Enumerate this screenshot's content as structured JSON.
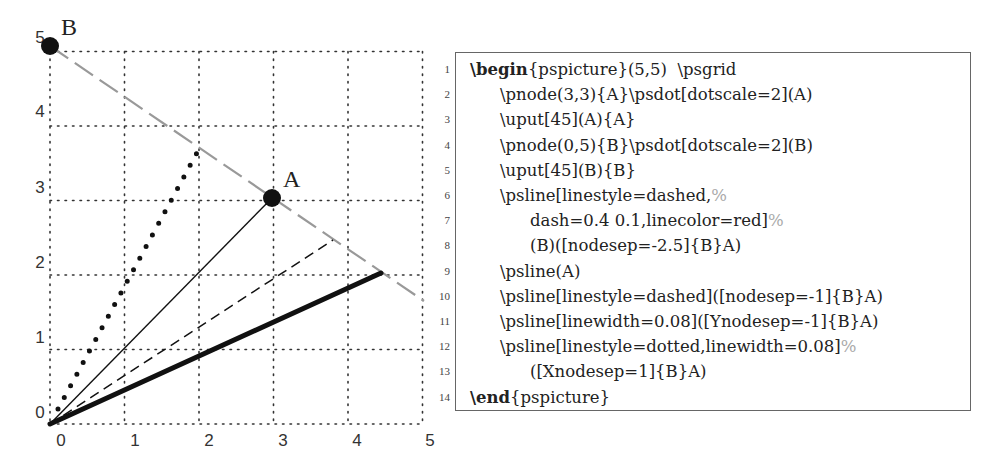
{
  "chart_data": {
    "type": "diagram",
    "title": "",
    "grid": {
      "xmin": 0,
      "xmax": 5,
      "ymin": 0,
      "ymax": 5,
      "style": "dotted"
    },
    "x_tick_labels": [
      "0",
      "1",
      "2",
      "3",
      "4",
      "5"
    ],
    "y_tick_labels": [
      "0",
      "1",
      "2",
      "3",
      "4",
      "5"
    ],
    "nodes": [
      {
        "name": "A",
        "x": 3,
        "y": 3,
        "label": "A",
        "dotscale": 2
      },
      {
        "name": "B",
        "x": 0,
        "y": 5,
        "label": "B",
        "dotscale": 2
      }
    ],
    "lines": [
      {
        "id": "extended-dashed-gray",
        "style": "long-dashed",
        "color": "#999999",
        "from": [
          0,
          5
        ],
        "to": [
          5,
          1.67
        ]
      },
      {
        "id": "solid-to-A",
        "style": "solid",
        "color": "#000000",
        "from": [
          0,
          0
        ],
        "to": [
          3,
          3
        ]
      },
      {
        "id": "dashed-nodesep",
        "style": "dashed",
        "color": "#000000",
        "from": [
          0,
          0
        ],
        "to": [
          3.83,
          2.45
        ]
      },
      {
        "id": "thick-ynodesep",
        "style": "solid-thick",
        "color": "#000000",
        "from": [
          0,
          0
        ],
        "to": [
          4.5,
          2
        ]
      },
      {
        "id": "dotted-xnodesep",
        "style": "dotted-thick",
        "color": "#000000",
        "from": [
          0,
          0
        ],
        "to": [
          2,
          3.67
        ]
      }
    ]
  },
  "figure": {
    "axis": {
      "x_labels": [
        "0",
        "1",
        "2",
        "3",
        "4",
        "5"
      ],
      "y_labels": [
        "0",
        "1",
        "2",
        "3",
        "4",
        "5"
      ]
    },
    "node_labels": {
      "A": "A",
      "B": "B"
    }
  },
  "code": {
    "lines": [
      {
        "n": "1",
        "kw": "\\begin",
        "text": "{pspicture}(5,5)  \\psgrid",
        "cmt": "",
        "indent": 0
      },
      {
        "n": "2",
        "kw": "",
        "text": "\\pnode(3,3){A}\\psdot[dotscale=2](A)",
        "cmt": "",
        "indent": 1
      },
      {
        "n": "3",
        "kw": "",
        "text": "\\uput[45](A){A}",
        "cmt": "",
        "indent": 1
      },
      {
        "n": "4",
        "kw": "",
        "text": "\\pnode(0,5){B}\\psdot[dotscale=2](B)",
        "cmt": "",
        "indent": 1
      },
      {
        "n": "5",
        "kw": "",
        "text": "\\uput[45](B){B}",
        "cmt": "",
        "indent": 1
      },
      {
        "n": "6",
        "kw": "",
        "text": "\\psline[linestyle=dashed,",
        "cmt": "%",
        "indent": 1
      },
      {
        "n": "7",
        "kw": "",
        "text": "dash=0.4 0.1,linecolor=red]",
        "cmt": "%",
        "indent": 2
      },
      {
        "n": "8",
        "kw": "",
        "text": "(B)([nodesep=-2.5]{B}A)",
        "cmt": "",
        "indent": 2
      },
      {
        "n": "9",
        "kw": "",
        "text": "\\psline(A)",
        "cmt": "",
        "indent": 1
      },
      {
        "n": "10",
        "kw": "",
        "text": "\\psline[linestyle=dashed]([nodesep=-1]{B}A)",
        "cmt": "",
        "indent": 1
      },
      {
        "n": "11",
        "kw": "",
        "text": "\\psline[linewidth=0.08]([Ynodesep=-1]{B}A)",
        "cmt": "",
        "indent": 1
      },
      {
        "n": "12",
        "kw": "",
        "text": "\\psline[linestyle=dotted,linewidth=0.08]",
        "cmt": "%",
        "indent": 1
      },
      {
        "n": "13",
        "kw": "",
        "text": "([Xnodesep=1]{B}A)",
        "cmt": "",
        "indent": 2
      },
      {
        "n": "14",
        "kw": "\\end",
        "text": "{pspicture}",
        "cmt": "",
        "indent": 0
      }
    ]
  }
}
